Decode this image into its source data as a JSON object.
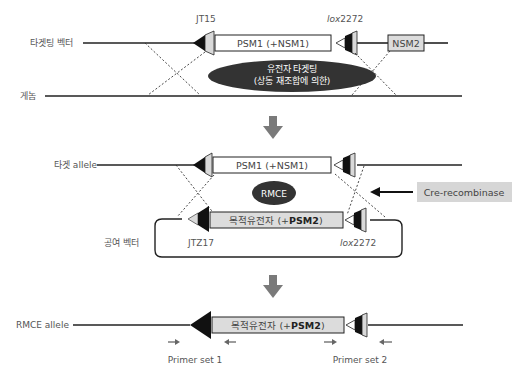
{
  "colors": {
    "line": "#222222",
    "ellipse": "#333333",
    "step_arrow": "#7a7a7a",
    "box_fill_light": "#ffffff",
    "box_fill_gray": "#dcdcdc",
    "label_gray": "#555555",
    "cre_box": "#d6d6d6"
  },
  "stage1": {
    "targeting_vector_label": "타겟팅 벡터",
    "genome_label": "게놈",
    "left_site_label": "JT15",
    "right_site_label_italic": "lox",
    "right_site_label_num": "2272",
    "cassette_label": "PSM1 (+NSM1)",
    "nsm2_label": "NSM2",
    "ellipse_line1": "유전자 타겟팅",
    "ellipse_line2": "(상동 재조합에 의한)"
  },
  "stage2": {
    "target_allele_label": "타겟 allele",
    "cassette_label": "PSM1 (+NSM1)",
    "rmce_label": "RMCE",
    "cre_label": "Cre-recombinase",
    "donor_vector_label": "공여 벡터",
    "donor_cassette_prefix": "목적유전자 (+",
    "donor_cassette_bold": "PSM2",
    "donor_cassette_suffix": ")",
    "left_site_label": "JTZ17",
    "right_site_label_italic": "lox",
    "right_site_label_num": "2272"
  },
  "stage3": {
    "rmce_allele_label": "RMCE allele",
    "cassette_prefix": "목적유전자 (+",
    "cassette_bold": "PSM2",
    "cassette_suffix": ")",
    "primer_set_1": "Primer set 1",
    "primer_set_2": "Primer set 2"
  }
}
